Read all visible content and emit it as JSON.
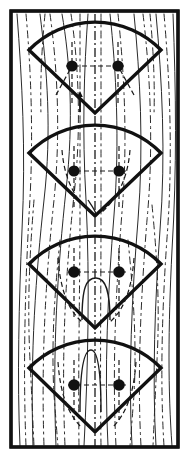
{
  "figure": {
    "title": "Sector fan pattern over striated background",
    "caption": "",
    "background_color": "#ffffff",
    "ink_color": "#111111",
    "frame": {
      "name": "outer-rectangular-border",
      "x": 11,
      "y": 11,
      "width": 167,
      "height": 436,
      "stroke_width": 3.2
    },
    "fans": [
      {
        "index": 1,
        "label": "fan-1",
        "apex_x": 95,
        "apex_y": 113,
        "left_corner_x": 29,
        "left_corner_y": 50,
        "right_corner_x": 161,
        "right_corner_y": 50,
        "arc_top_y": 30,
        "stroke_width": 3.4,
        "dots": [
          {
            "cx": 72,
            "cy": 66,
            "r": 5.6
          },
          {
            "cx": 118,
            "cy": 66,
            "r": 5.6
          }
        ],
        "has_interior_arch": false,
        "has_arrow_marker": true,
        "arrow_x": 80,
        "arrow_top_y": 92,
        "arrow_bottom_y": 112
      },
      {
        "index": 2,
        "label": "fan-2",
        "apex_x": 95,
        "apex_y": 216,
        "left_corner_x": 29,
        "left_corner_y": 153,
        "right_corner_x": 161,
        "right_corner_y": 153,
        "arc_top_y": 133,
        "stroke_width": 3.4,
        "dots": [
          {
            "cx": 74,
            "cy": 171,
            "r": 5.6
          },
          {
            "cx": 119,
            "cy": 171,
            "r": 5.6
          }
        ],
        "has_interior_arch": false,
        "has_arrow_marker": false
      },
      {
        "index": 3,
        "label": "fan-3",
        "apex_x": 95,
        "apex_y": 328,
        "left_corner_x": 29,
        "left_corner_y": 264,
        "right_corner_x": 161,
        "right_corner_y": 264,
        "arc_top_y": 243,
        "stroke_width": 3.4,
        "dots": [
          {
            "cx": 74,
            "cy": 272,
            "r": 5.8
          },
          {
            "cx": 119,
            "cy": 272,
            "r": 5.8
          }
        ],
        "has_interior_arch": true,
        "arch_peak_x": 96,
        "arch_peak_y": 278,
        "arch_base_y": 320,
        "arch_half_width": 14,
        "has_arrow_marker": false
      },
      {
        "index": 4,
        "label": "fan-4",
        "apex_x": 95,
        "apex_y": 432,
        "left_corner_x": 29,
        "left_corner_y": 368,
        "right_corner_x": 161,
        "right_corner_y": 368,
        "arc_top_y": 346,
        "stroke_width": 3.4,
        "dots": [
          {
            "cx": 74,
            "cy": 385,
            "r": 5.8
          },
          {
            "cx": 119,
            "cy": 385,
            "r": 5.8
          }
        ],
        "has_interior_arch": true,
        "arch_peak_x": 91,
        "arch_peak_y": 350,
        "arch_base_y": 410,
        "arch_half_width": 11,
        "has_arrow_marker": false
      }
    ],
    "centerline": {
      "name": "vertical-dash-dot-centerline",
      "x": 95,
      "y_start": 14,
      "y_end": 446,
      "dash_pattern": "9 3 2 3"
    },
    "background_striations": {
      "description": "Thin hand-drawn solid and dash-dot near-vertical curved lines spanning the frame interior",
      "count": 22,
      "solid_count": 8,
      "dashed_count": 14,
      "stroke_width": 1.0
    }
  }
}
